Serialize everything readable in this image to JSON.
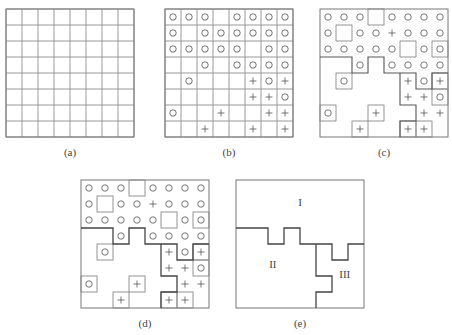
{
  "panels": [
    {
      "id": "a",
      "caption": "(a)"
    },
    {
      "id": "b",
      "caption": "(b)"
    },
    {
      "id": "c",
      "caption": "(c)"
    },
    {
      "id": "d",
      "caption": "(d)"
    },
    {
      "id": "e",
      "caption": "(e)"
    }
  ],
  "grid_size": 8,
  "marks_b": [
    "OOO_OOOO",
    "O_OOOOOO",
    "OOOOO_OO",
    "__O_OOOO",
    "_O___+O+",
    "_____++O",
    "O__+__++",
    "__+__+_+"
  ],
  "marks_cd": [
    "OOO_OOOO",
    "O_OO+OOO",
    "OOOOO_OO",
    "__O_OOOO",
    "_O___+O+",
    "_____++O",
    "O__+__++",
    "__+__++_+"
  ],
  "boxed_cells": [
    [
      0,
      3
    ],
    [
      1,
      1
    ],
    [
      2,
      5
    ],
    [
      2,
      7
    ],
    [
      4,
      1
    ],
    [
      4,
      7
    ],
    [
      5,
      7
    ],
    [
      6,
      0
    ],
    [
      6,
      3
    ],
    [
      7,
      2
    ],
    [
      7,
      5
    ],
    [
      7,
      6
    ]
  ],
  "region_labels": {
    "I": "I",
    "II": "II",
    "III": "III"
  }
}
